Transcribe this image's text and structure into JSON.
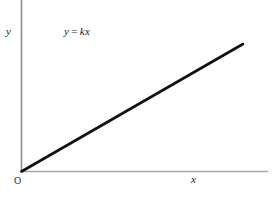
{
  "figure": {
    "background_color": "#ffffff",
    "width": 276,
    "height": 202
  },
  "labels": {
    "y_axis": "y",
    "x_axis": "x",
    "origin": "O",
    "equation_lhs": "y",
    "equation_operator": "=",
    "equation_rhs": "kx",
    "equation_full": "y = kx"
  },
  "colors": {
    "y_axis": "#8c8c8c",
    "x_axis": "#aaaaaa",
    "data_line": "#111111",
    "text": "#1a1a1a"
  },
  "chart_data": {
    "type": "line",
    "title": "",
    "annotations": [
      "y = kx"
    ],
    "xlabel": "x",
    "ylabel": "y",
    "grid": false,
    "legend": null,
    "axis_origin_label": "O",
    "xlim": [
      0,
      1
    ],
    "ylim": [
      0,
      1
    ],
    "x_ticks": [],
    "y_ticks": [],
    "series": [
      {
        "name": "y = kx",
        "relation": "proportional",
        "slope_symbol": "k",
        "intercept": 0,
        "x": [
          0,
          1
        ],
        "values": [
          0,
          1
        ],
        "color": "#111111",
        "linewidth": 2.6
      }
    ]
  }
}
